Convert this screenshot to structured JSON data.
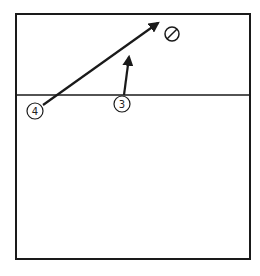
{
  "colors": {
    "background": "#ffffff",
    "ink": "#1a1a1a"
  },
  "court": {
    "x": 16,
    "y": 14,
    "width": 234,
    "height": 245,
    "divider_y": 95
  },
  "players": [
    {
      "label": "4",
      "cx": 35,
      "cy": 111,
      "r": 8
    },
    {
      "label": "3",
      "cx": 122,
      "cy": 104,
      "r": 8
    }
  ],
  "target": {
    "symbol": "null-circle",
    "cx": 172,
    "cy": 34,
    "r": 7
  },
  "arrows": [
    {
      "from": "4",
      "x1": 43,
      "y1": 105,
      "x2": 158,
      "y2": 23
    },
    {
      "from": "3",
      "x1": 124,
      "y1": 95,
      "x2": 129,
      "y2": 57
    }
  ]
}
